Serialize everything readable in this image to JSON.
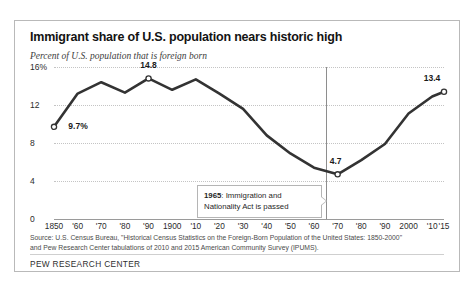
{
  "chart_data": {
    "type": "line",
    "title": "Immigrant share of U.S. population nears historic high",
    "subtitle": "Percent of U.S. population that is foreign born",
    "xlabel": "",
    "ylabel": "",
    "ylim": [
      0,
      16
    ],
    "xlim": [
      1850,
      2015
    ],
    "grid": true,
    "legend": "none",
    "y_ticks": [
      "0",
      "4",
      "8",
      "12",
      "16%"
    ],
    "y_tick_values": [
      0,
      4,
      8,
      12,
      16
    ],
    "x_tick_labels": [
      "1850",
      "'60",
      "'70",
      "'80",
      "'90",
      "1900",
      "'10",
      "'20",
      "'30",
      "'40",
      "'50",
      "'60",
      "'70",
      "'80",
      "'90",
      "2000",
      "'10",
      "'15"
    ],
    "x_tick_values": [
      1850,
      1860,
      1870,
      1880,
      1890,
      1900,
      1910,
      1920,
      1930,
      1940,
      1950,
      1960,
      1970,
      1980,
      1990,
      2000,
      2010,
      2015
    ],
    "x": [
      1850,
      1860,
      1870,
      1880,
      1890,
      1900,
      1910,
      1920,
      1930,
      1940,
      1950,
      1960,
      1970,
      1980,
      1990,
      2000,
      2010,
      2015
    ],
    "values": [
      9.7,
      13.2,
      14.4,
      13.3,
      14.8,
      13.6,
      14.7,
      13.2,
      11.6,
      8.8,
      6.9,
      5.4,
      4.7,
      6.2,
      7.9,
      11.1,
      12.9,
      13.4
    ],
    "series": [
      {
        "name": "Percent of U.S. population that is foreign born",
        "values": [
          9.7,
          13.2,
          14.4,
          13.3,
          14.8,
          13.6,
          14.7,
          13.2,
          11.6,
          8.8,
          6.9,
          5.4,
          4.7,
          6.2,
          7.9,
          11.1,
          12.9,
          13.4
        ]
      }
    ],
    "point_labels": [
      {
        "x": 1850,
        "y": 9.7,
        "text": "9.7%"
      },
      {
        "x": 1890,
        "y": 14.8,
        "text": "14.8"
      },
      {
        "x": 1970,
        "y": 4.7,
        "text": "4.7"
      },
      {
        "x": 2015,
        "y": 13.4,
        "text": "13.4"
      }
    ],
    "markers": [
      {
        "x": 1850,
        "y": 9.7
      },
      {
        "x": 1890,
        "y": 14.8
      },
      {
        "x": 1970,
        "y": 4.7
      },
      {
        "x": 2015,
        "y": 13.4
      }
    ],
    "reference_line": {
      "x": 1965,
      "orientation": "vertical"
    },
    "annotations": [
      {
        "year": "1965",
        "text": ": Immigration and Nationality Act is passed"
      }
    ],
    "line_color": "#333333"
  },
  "annotation": {
    "year": "1965",
    "rest": ": Immigration and Nationality Act is passed"
  },
  "source": {
    "line1": "Source: U.S. Census Bureau, \"Historical Census Statistics on the Foreign-Born Population of the United States: 1850-2000\"",
    "line2": "and Pew Research Center tabulations of 2010 and 2015 American Community Survey (IPUMS)."
  },
  "footer": {
    "brand": "PEW RESEARCH CENTER"
  }
}
